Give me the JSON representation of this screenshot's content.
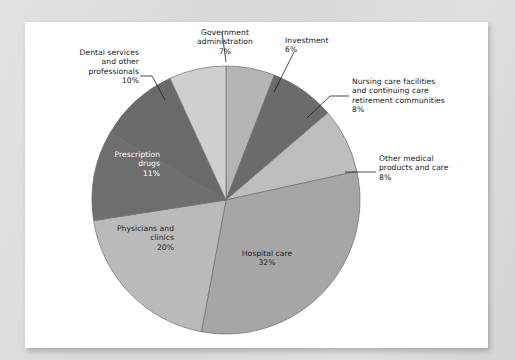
{
  "figure": {
    "background_color": "#dcdcdc",
    "paper_color": "#ffffff",
    "title": ""
  },
  "chart_data": {
    "type": "pie",
    "title": "",
    "subtitle": "",
    "xlabel": "",
    "ylabel": "",
    "units": "percent",
    "total": 102,
    "start_angle_deg": 0,
    "direction": "clockwise",
    "legend_position": "none",
    "grid": false,
    "labels_show_percent": true,
    "categories": [
      "Investment",
      "Nursing care facilities and continuing care retirement communities",
      "Other medical products and care",
      "Hospital care",
      "Physicians and clinics",
      "Prescription drugs",
      "Dental services and other professionals",
      "Government administration"
    ],
    "values": [
      6,
      8,
      8,
      32,
      20,
      11,
      10,
      7
    ],
    "colors": [
      "#b4b4b4",
      "#6b6b6b",
      "#bdbdbd",
      "#a6a6a6",
      "#bababa",
      "#6e6e6e",
      "#6a6a6a",
      "#cfcfcf"
    ],
    "slices": [
      {
        "name": "investment",
        "label": "Investment",
        "percent_text": "6%",
        "value": 6,
        "color": "#b4b4b4",
        "label_placement": "outside",
        "label_align": "left"
      },
      {
        "name": "nursing-care",
        "label": "Nursing care facilities\nand continuing care\nretirement communities",
        "percent_text": "8%",
        "value": 8,
        "color": "#6b6b6b",
        "label_placement": "outside",
        "label_align": "left"
      },
      {
        "name": "other-medical",
        "label": "Other medical\nproducts and care",
        "percent_text": "8%",
        "value": 8,
        "color": "#bdbdbd",
        "label_placement": "outside",
        "label_align": "left"
      },
      {
        "name": "hospital-care",
        "label": "Hospital care",
        "percent_text": "32%",
        "value": 32,
        "color": "#a6a6a6",
        "label_placement": "inside",
        "label_align": "center"
      },
      {
        "name": "physicians-clinics",
        "label": "Physicians and\nclinics",
        "percent_text": "20%",
        "value": 20,
        "color": "#bababa",
        "label_placement": "inside",
        "label_align": "right"
      },
      {
        "name": "prescription-drugs",
        "label": "Prescription\ndrugs",
        "percent_text": "11%",
        "value": 11,
        "color": "#6e6e6e",
        "label_placement": "inside",
        "label_align": "right"
      },
      {
        "name": "dental-services",
        "label": "Dental services\nand other\nprofessionals",
        "percent_text": "10%",
        "value": 10,
        "color": "#6a6a6a",
        "label_placement": "outside",
        "label_align": "right"
      },
      {
        "name": "government-administration",
        "label": "Government\nadministration",
        "percent_text": "7%",
        "value": 7,
        "color": "#cfcfcf",
        "label_placement": "outside",
        "label_align": "center"
      }
    ]
  },
  "labels": {
    "government": {
      "text": "Government\nadministration\n7%"
    },
    "investment": {
      "text": "Investment\n6%"
    },
    "nursing": {
      "text": "Nursing care facilities\nand continuing care\nretirement communities\n8%"
    },
    "other_medical": {
      "text": "Other medical\nproducts and care\n8%"
    },
    "dental": {
      "text": "Dental services\nand other\nprofessionals\n10%"
    },
    "prescription": {
      "text": "Prescription\ndrugs\n11%"
    },
    "physicians": {
      "text": "Physicians and\nclinics\n20%"
    },
    "hospital": {
      "text": "Hospital care\n32%"
    }
  }
}
